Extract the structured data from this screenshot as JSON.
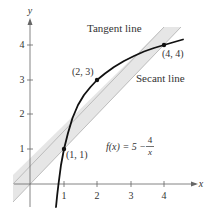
{
  "figure": {
    "function_label": "f(x) = 5 − 4/x",
    "function_label_parts": {
      "lhs": "f(x) = 5 −",
      "num": "4",
      "den": "x"
    },
    "tangent_label": "Tangent line",
    "secant_label": "Secant line",
    "axes": {
      "x_label": "x",
      "y_label": "y"
    },
    "x_ticks": [
      "1",
      "2",
      "3",
      "4"
    ],
    "y_ticks": [
      "1",
      "2",
      "3",
      "4"
    ],
    "points": [
      {
        "label": "(1, 1)",
        "x": 1,
        "y": 1
      },
      {
        "label": "(2, 3)",
        "x": 2,
        "y": 3
      },
      {
        "label": "(4, 4)",
        "x": 4,
        "y": 4
      }
    ],
    "colors": {
      "band": "#e6e6e6",
      "band_edge": "#b0b0b0",
      "curve": "#111111",
      "axis": "#666666"
    }
  }
}
